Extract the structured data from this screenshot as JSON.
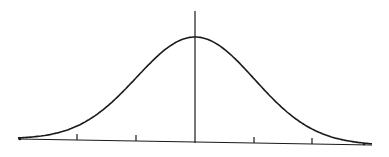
{
  "figure": {
    "stroke_color": "#1a1a1a",
    "background": "#ffffff"
  },
  "chart_data": {
    "type": "line",
    "title": "",
    "xlabel": "",
    "ylabel": "",
    "x": [
      -3,
      -2.5,
      -2,
      -1.5,
      -1,
      -0.5,
      0,
      0.5,
      1,
      1.5,
      2,
      2.5,
      3
    ],
    "values": [
      0.0044,
      0.0175,
      0.054,
      0.1295,
      0.242,
      0.3521,
      0.3989,
      0.3521,
      0.242,
      0.1295,
      0.054,
      0.0175,
      0.0044
    ],
    "xticks": [
      -2,
      -1,
      0,
      1,
      2
    ],
    "xlim": [
      -3,
      3
    ],
    "ylim": [
      0,
      0.45
    ],
    "grid": false,
    "legend": null
  }
}
